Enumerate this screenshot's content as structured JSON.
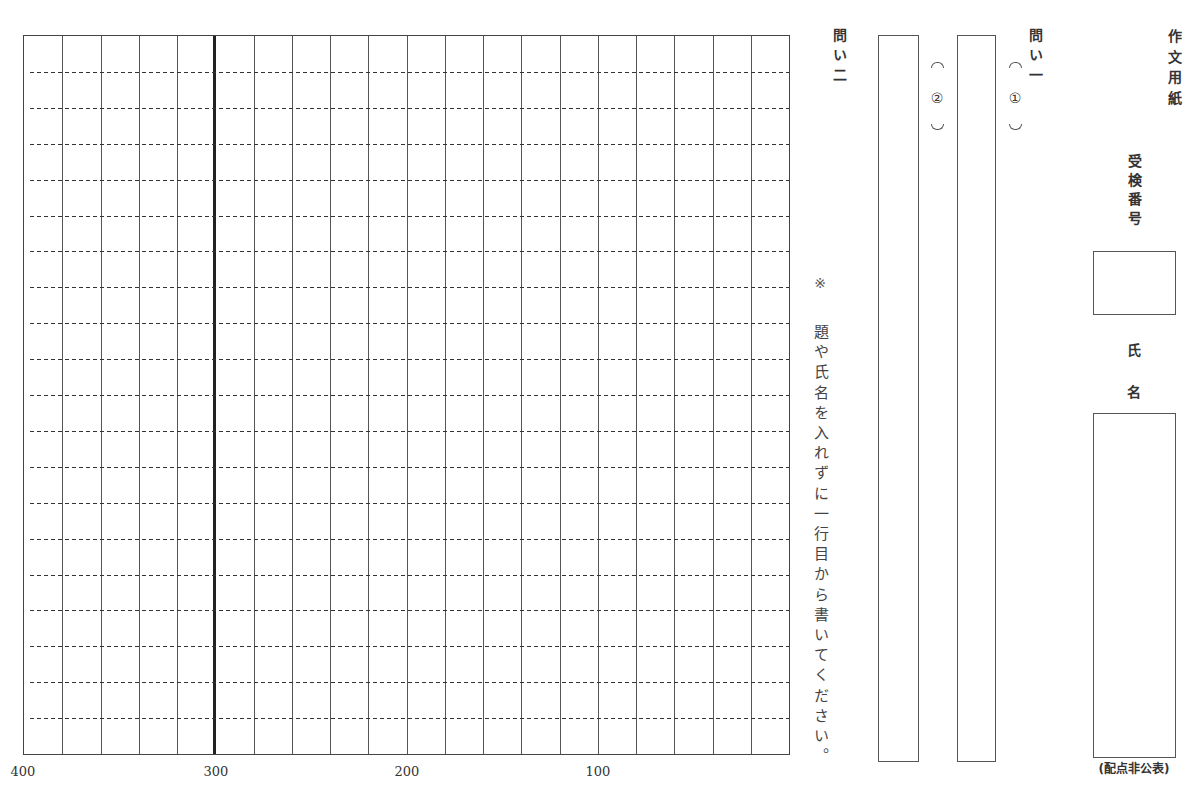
{
  "header": {
    "title": "作文用紙",
    "exam_number_label": "受検番号",
    "name_label_chars": [
      "氏",
      "名"
    ],
    "score_note": "(配点非公表)"
  },
  "question1": {
    "label": "問い一",
    "parts": [
      {
        "label": "①"
      },
      {
        "label": "②"
      }
    ]
  },
  "question2": {
    "label": "問い二",
    "note_mark": "※",
    "note": "題や氏名を入れずに一行目から書いてください。"
  },
  "grid": {
    "columns": 20,
    "rows": 20,
    "counter_labels": [
      "400",
      "300",
      "200",
      "100"
    ]
  }
}
